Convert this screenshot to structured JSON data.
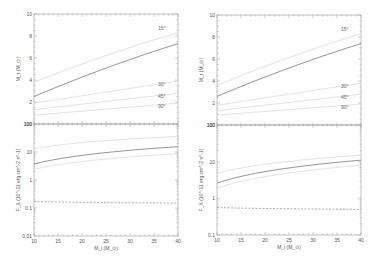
{
  "chart_data": [
    {
      "panel": "top-left",
      "type": "line",
      "xlabel": "M_i (M_⊙)",
      "ylabel": "M_r (M_⊙)",
      "xlim": [
        10,
        40
      ],
      "ylim": [
        0,
        10
      ],
      "yscale": "linear",
      "xticks": [
        10,
        15,
        20,
        25,
        30,
        35,
        40
      ],
      "yticks": [
        2,
        4,
        6,
        8,
        10
      ],
      "x": [
        10,
        40
      ],
      "series": [
        {
          "name": "15°",
          "style": "light",
          "values": [
            3.8,
            8.3
          ]
        },
        {
          "name": "main",
          "style": "dark",
          "values": [
            2.5,
            7.3
          ]
        },
        {
          "name": "30°",
          "style": "light",
          "values": [
            1.9,
            3.9
          ]
        },
        {
          "name": "45°",
          "style": "light",
          "values": [
            1.3,
            2.8
          ]
        },
        {
          "name": "90°",
          "style": "light",
          "values": [
            0.8,
            1.9
          ]
        }
      ]
    },
    {
      "panel": "bottom-left",
      "type": "line",
      "xlabel": "M_i (M_⊙)",
      "ylabel": "F_X (10^-11 erg cm^-2 s^-1)",
      "xlim": [
        10,
        40
      ],
      "ylim": [
        0.01,
        100
      ],
      "yscale": "log",
      "xticks": [
        10,
        15,
        20,
        25,
        30,
        35,
        40
      ],
      "yticks": [
        "0.01",
        "0.1",
        "1",
        "10",
        "100"
      ],
      "x": [
        10,
        40
      ],
      "series": [
        {
          "name": "upper",
          "style": "light",
          "values": [
            13,
            36
          ]
        },
        {
          "name": "main",
          "style": "dark",
          "values": [
            3.7,
            15.5
          ]
        },
        {
          "name": "lower",
          "style": "light",
          "values": [
            2.4,
            8.7
          ]
        },
        {
          "name": "threshold",
          "style": "dashed",
          "values": [
            0.17,
            0.15
          ]
        }
      ]
    },
    {
      "panel": "top-right",
      "type": "line",
      "xlabel": "M_i (M_⊙)",
      "ylabel": "M_r (M_⊙)",
      "xlim": [
        10,
        40
      ],
      "ylim": [
        0,
        10
      ],
      "yscale": "linear",
      "xticks": [
        10,
        15,
        20,
        25,
        30,
        35,
        40
      ],
      "yticks": [
        2,
        4,
        6,
        8,
        10
      ],
      "x": [
        10,
        40
      ],
      "series": [
        {
          "name": "15°",
          "style": "light",
          "values": [
            3.6,
            8.3
          ]
        },
        {
          "name": "main",
          "style": "dark",
          "values": [
            2.6,
            7.4
          ]
        },
        {
          "name": "30°",
          "style": "light",
          "values": [
            1.8,
            3.8
          ]
        },
        {
          "name": "45°",
          "style": "light",
          "values": [
            1.3,
            2.8
          ]
        },
        {
          "name": "90°",
          "style": "light",
          "values": [
            0.9,
            1.9
          ]
        }
      ]
    },
    {
      "panel": "bottom-right",
      "type": "line",
      "xlabel": "M_i (M_⊙)",
      "ylabel": "F_X (10^-11 erg cm^-2 s^-1)",
      "xlim": [
        10,
        40
      ],
      "ylim": [
        0.1,
        100
      ],
      "yscale": "log",
      "xticks": [
        10,
        15,
        20,
        25,
        30,
        35,
        40
      ],
      "yticks": [
        "0.1",
        "1",
        "10",
        "100"
      ],
      "x": [
        10,
        40
      ],
      "series": [
        {
          "name": "upper",
          "style": "light",
          "values": [
            4.8,
            15
          ]
        },
        {
          "name": "main",
          "style": "dark",
          "values": [
            2.6,
            11
          ]
        },
        {
          "name": "lower",
          "style": "light",
          "values": [
            1.9,
            8
          ]
        },
        {
          "name": "threshold",
          "style": "dashed",
          "values": [
            0.56,
            0.5
          ]
        }
      ]
    }
  ],
  "colors": {
    "dark": "#777777",
    "light": "#d6d6d6",
    "axis": "#999999",
    "dashed": "#888888"
  }
}
